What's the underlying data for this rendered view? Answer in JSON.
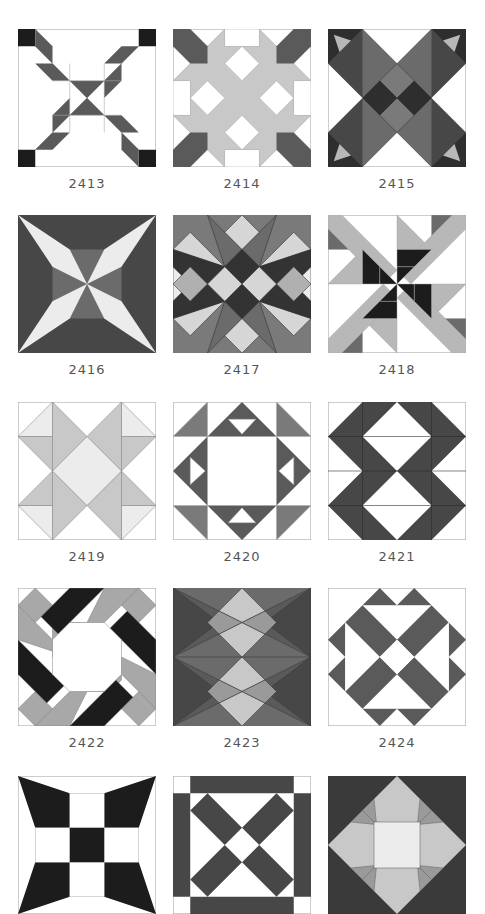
{
  "page": {
    "colors": {
      "white": "#ffffff",
      "very_light": "#ececec",
      "light": "#c8c8c8",
      "medium": "#8a8a8a",
      "dark": "#5a5a5a",
      "darker": "#474747",
      "black": "#1c1c1c",
      "outline": "#a8a8a8"
    }
  },
  "blocks": [
    {
      "number": "2413",
      "icon": "quilt-block-2413"
    },
    {
      "number": "2414",
      "icon": "quilt-block-2414"
    },
    {
      "number": "2415",
      "icon": "quilt-block-2415"
    },
    {
      "number": "2416",
      "icon": "quilt-block-2416"
    },
    {
      "number": "2417",
      "icon": "quilt-block-2417"
    },
    {
      "number": "2418",
      "icon": "quilt-block-2418"
    },
    {
      "number": "2419",
      "icon": "quilt-block-2419"
    },
    {
      "number": "2420",
      "icon": "quilt-block-2420"
    },
    {
      "number": "2421",
      "icon": "quilt-block-2421"
    },
    {
      "number": "2422",
      "icon": "quilt-block-2422"
    },
    {
      "number": "2423",
      "icon": "quilt-block-2423"
    },
    {
      "number": "2424",
      "icon": "quilt-block-2424"
    },
    {
      "number": "",
      "icon": "quilt-block-2425"
    },
    {
      "number": "",
      "icon": "quilt-block-2426"
    },
    {
      "number": "",
      "icon": "quilt-block-2427"
    }
  ]
}
